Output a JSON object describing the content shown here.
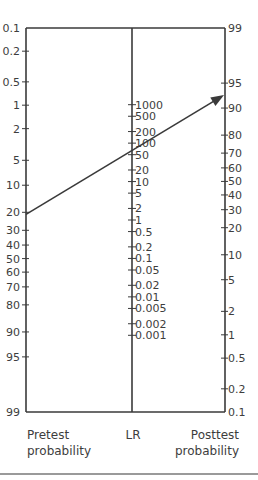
{
  "chart_data": {
    "type": "nomogram",
    "colors": {
      "lines": "#3a3a3a",
      "text": "#3d3d3d",
      "divider": "#9a9a9a"
    },
    "axes": [
      {
        "id": "pretest",
        "title_lines": [
          "Pretest",
          "probability"
        ],
        "ticks": [
          "0.1",
          "0.2",
          "0.5",
          "1",
          "2",
          "5",
          "10",
          "20",
          "30",
          "40",
          "50",
          "60",
          "70",
          "80",
          "90",
          "95",
          "99"
        ],
        "tick_values": [
          0.1,
          0.2,
          0.5,
          1,
          2,
          5,
          10,
          20,
          30,
          40,
          50,
          60,
          70,
          80,
          90,
          95,
          99
        ],
        "unit": "%"
      },
      {
        "id": "lr",
        "title_lines": [
          "LR"
        ],
        "ticks": [
          "1000",
          "500",
          "200",
          "100",
          "50",
          "20",
          "10",
          "5",
          "2",
          "1",
          "0.5",
          "0.2",
          "0.1",
          "0.05",
          "0.02",
          "0.01",
          "0.005",
          "0.002",
          "0.001"
        ],
        "tick_values": [
          1000,
          500,
          200,
          100,
          50,
          20,
          10,
          5,
          2,
          1,
          0.5,
          0.2,
          0.1,
          0.05,
          0.02,
          0.01,
          0.005,
          0.002,
          0.001
        ]
      },
      {
        "id": "posttest",
        "title_lines": [
          "Posttest",
          "probability"
        ],
        "ticks": [
          "99",
          "95",
          "90",
          "80",
          "70",
          "60",
          "50",
          "40",
          "30",
          "20",
          "10",
          "5",
          "2",
          "1",
          "0.5",
          "0.2",
          "0.1"
        ],
        "tick_values": [
          99,
          95,
          90,
          80,
          70,
          60,
          50,
          40,
          30,
          20,
          10,
          5,
          2,
          1,
          0.5,
          0.2,
          0.1
        ],
        "unit": "%"
      }
    ],
    "example_line": {
      "pretest_probability": 21,
      "likelihood_ratio": 50,
      "posttest_probability": 93,
      "arrow": "toward posttest"
    }
  }
}
